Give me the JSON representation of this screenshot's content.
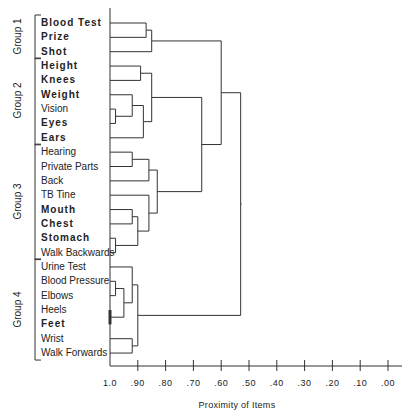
{
  "chart_data": {
    "type": "dendrogram",
    "title": "",
    "xlabel": "Proximity of Items",
    "ylabel": "",
    "xlim": [
      1.0,
      0.0
    ],
    "x_ticks": [
      "1.0",
      ".90",
      ".80",
      ".70",
      ".60",
      ".50",
      ".40",
      ".30",
      ".20",
      ".10",
      ".00"
    ],
    "leaves": [
      {
        "label": "Blood Test",
        "bold": true,
        "group": "Group 1"
      },
      {
        "label": "Prize",
        "bold": true,
        "group": "Group 1"
      },
      {
        "label": "Shot",
        "bold": true,
        "group": "Group 1"
      },
      {
        "label": "Height",
        "bold": true,
        "group": "Group 2"
      },
      {
        "label": "Knees",
        "bold": true,
        "group": "Group 2"
      },
      {
        "label": "Weight",
        "bold": true,
        "group": "Group 2"
      },
      {
        "label": "Vision",
        "bold": false,
        "group": "Group 2"
      },
      {
        "label": "Eyes",
        "bold": true,
        "group": "Group 2"
      },
      {
        "label": "Ears",
        "bold": true,
        "group": "Group 2"
      },
      {
        "label": "Hearing",
        "bold": false,
        "group": "Group 3"
      },
      {
        "label": "Private Parts",
        "bold": false,
        "group": "Group 3"
      },
      {
        "label": "Back",
        "bold": false,
        "group": "Group 3"
      },
      {
        "label": "TB Tine",
        "bold": false,
        "group": "Group 3"
      },
      {
        "label": "Mouth",
        "bold": true,
        "group": "Group 3"
      },
      {
        "label": "Chest",
        "bold": true,
        "group": "Group 3"
      },
      {
        "label": "Stomach",
        "bold": true,
        "group": "Group 3"
      },
      {
        "label": "Walk Backwards",
        "bold": false,
        "group": "Group 3"
      },
      {
        "label": "Urine Test",
        "bold": false,
        "group": "Group 4"
      },
      {
        "label": "Blood Pressure",
        "bold": false,
        "group": "Group 4"
      },
      {
        "label": "Elbows",
        "bold": false,
        "group": "Group 4"
      },
      {
        "label": "Heels",
        "bold": false,
        "group": "Group 4"
      },
      {
        "label": "Feet",
        "bold": true,
        "group": "Group 4"
      },
      {
        "label": "Wrist",
        "bold": false,
        "group": "Group 4"
      },
      {
        "label": "Walk Forwards",
        "bold": false,
        "group": "Group 4"
      }
    ],
    "groups": [
      {
        "label": "Group 1",
        "from": 0,
        "to": 2
      },
      {
        "label": "Group 2",
        "from": 3,
        "to": 8
      },
      {
        "label": "Group 3",
        "from": 9,
        "to": 16
      },
      {
        "label": "Group 4",
        "from": 17,
        "to": 23
      }
    ],
    "merges": [
      {
        "id": "A",
        "children": [
          "Blood Test",
          "Prize"
        ],
        "proximity": 0.87
      },
      {
        "id": "B",
        "children": [
          "A",
          "Shot"
        ],
        "proximity": 0.85
      },
      {
        "id": "C",
        "children": [
          "Height",
          "Knees"
        ],
        "proximity": 0.89
      },
      {
        "id": "D",
        "children": [
          "Vision",
          "Eyes"
        ],
        "proximity": 0.98
      },
      {
        "id": "E",
        "children": [
          "Weight",
          "D"
        ],
        "proximity": 0.92
      },
      {
        "id": "F",
        "children": [
          "E",
          "Ears"
        ],
        "proximity": 0.88
      },
      {
        "id": "G",
        "children": [
          "C",
          "F"
        ],
        "proximity": 0.85
      },
      {
        "id": "H",
        "children": [
          "Hearing",
          "Private Parts"
        ],
        "proximity": 0.92
      },
      {
        "id": "I",
        "children": [
          "H",
          "Back"
        ],
        "proximity": 0.86
      },
      {
        "id": "J",
        "children": [
          "Mouth",
          "Chest"
        ],
        "proximity": 0.92
      },
      {
        "id": "K",
        "children": [
          "Stomach",
          "Walk Backwards"
        ],
        "proximity": 0.98
      },
      {
        "id": "L",
        "children": [
          "J",
          "K"
        ],
        "proximity": 0.9
      },
      {
        "id": "M",
        "children": [
          "TB Tine",
          "L"
        ],
        "proximity": 0.86
      },
      {
        "id": "N",
        "children": [
          "I",
          "M"
        ],
        "proximity": 0.83
      },
      {
        "id": "O",
        "children": [
          "G",
          "N"
        ],
        "proximity": 0.67
      },
      {
        "id": "P",
        "children": [
          "B",
          "O"
        ],
        "proximity": 0.6
      },
      {
        "id": "Q",
        "children": [
          "Blood Pressure",
          "Elbows"
        ],
        "proximity": 0.98
      },
      {
        "id": "R",
        "children": [
          "Q",
          "Heels/Feet"
        ],
        "proximity": 0.95
      },
      {
        "id": "S",
        "children": [
          "Urine Test",
          "R"
        ],
        "proximity": 0.92
      },
      {
        "id": "T",
        "children": [
          "Wrist",
          "Walk Forwards"
        ],
        "proximity": 0.92
      },
      {
        "id": "U",
        "children": [
          "S",
          "T"
        ],
        "proximity": 0.9
      },
      {
        "id": "V",
        "children": [
          "P",
          "U"
        ],
        "proximity": 0.53
      }
    ]
  },
  "axis_title": "Proximity of Items"
}
